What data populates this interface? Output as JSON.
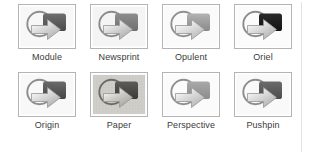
{
  "gallery": {
    "name": "theme-gallery",
    "columns": 4,
    "rows": 2,
    "background": "#ffffff",
    "frame_border_color": "#b4b4b4",
    "label_color": "#3b3b3b",
    "themes": [
      {
        "label": "Module",
        "icon": "theme-thumbnail",
        "bg": "#f7f7f7",
        "block_top": "#6e6e6e",
        "block_bottom": "#4a4a4a",
        "arrow_light": "#d8d8d8",
        "arrow_dark": "#a8a8a8",
        "ring": "#8e8e8e",
        "textured": false
      },
      {
        "label": "Newsprint",
        "icon": "theme-thumbnail",
        "bg": "#f4f4f4",
        "block_top": "#8d8d8d",
        "block_bottom": "#6f6f6f",
        "arrow_light": "#d5d5d5",
        "arrow_dark": "#a5a5a5",
        "ring": "#8a8a8a",
        "textured": false
      },
      {
        "label": "Opulent",
        "icon": "theme-thumbnail",
        "bg": "#fafafa",
        "block_top": "#b2b2b2",
        "block_bottom": "#8a8a8a",
        "arrow_light": "#dedede",
        "arrow_dark": "#b0b0b0",
        "ring": "#909090",
        "textured": false
      },
      {
        "label": "Oriel",
        "icon": "theme-thumbnail",
        "bg": "#fbfbfb",
        "block_top": "#2a2a2a",
        "block_bottom": "#121212",
        "arrow_light": "#d9d9d9",
        "arrow_dark": "#a6a6a6",
        "ring": "#8b8b8b",
        "textured": false
      },
      {
        "label": "Origin",
        "icon": "theme-thumbnail",
        "bg": "#f8f8f8",
        "block_top": "#6a6a6a",
        "block_bottom": "#454545",
        "arrow_light": "#d7d7d7",
        "arrow_dark": "#a7a7a7",
        "ring": "#8d8d8d",
        "textured": false
      },
      {
        "label": "Paper",
        "icon": "theme-thumbnail",
        "bg": "#cfcdc8",
        "block_top": "#5e5c58",
        "block_bottom": "#3c3a36",
        "arrow_light": "#cdcbc6",
        "arrow_dark": "#9e9c97",
        "ring": "#6e6c68",
        "textured": true
      },
      {
        "label": "Perspective",
        "icon": "theme-thumbnail",
        "bg": "#fbfbfb",
        "block_top": "#a9a9a9",
        "block_bottom": "#8b8b8b",
        "arrow_light": "#d9d9d9",
        "arrow_dark": "#adadad",
        "ring": "#8f8f8f",
        "textured": false
      },
      {
        "label": "Pushpin",
        "icon": "theme-thumbnail",
        "bg": "#f9f9f9",
        "block_top": "#6b6b6b",
        "block_bottom": "#4c4c4c",
        "arrow_light": "#d8d8d8",
        "arrow_dark": "#a9a9a9",
        "ring": "#8c8c8c",
        "textured": false
      }
    ]
  }
}
